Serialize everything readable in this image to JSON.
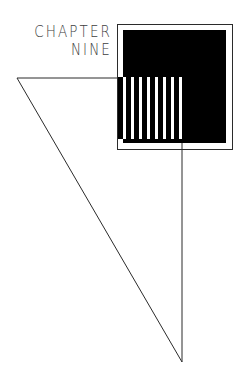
{
  "page": {
    "width": 247,
    "height": 367,
    "background": "#ffffff",
    "kind": "chapter-divider-illustration"
  },
  "heading": {
    "line1": "CHAPTER",
    "line2": "NINE",
    "color": "#3d3d3d"
  },
  "colors": {
    "ink": "#000000",
    "line": "#2b2b2b",
    "paper": "#ffffff",
    "text": "#3d3d3d"
  },
  "shapes": {
    "outer_frame": {
      "name": "outer-frame-rectangle",
      "x": 117,
      "y": 24,
      "width": 115,
      "height": 125,
      "stroke": "#2b2b2b",
      "stroke_width": 1,
      "fill": "none"
    },
    "black_square": {
      "name": "black-filled-square",
      "x": 123,
      "y": 30,
      "width": 103,
      "height": 113,
      "fill": "#000000"
    },
    "stripes": {
      "name": "vertical-stripe-band",
      "x": 118,
      "y": 77,
      "width": 65,
      "height": 62,
      "count": 8,
      "bar_width": 5,
      "gap_width": 3,
      "bar_fill": "#000000",
      "gap_fill": "#ffffff"
    },
    "triangle": {
      "name": "outline-triangle",
      "points": [
        [
          17,
          78
        ],
        [
          182,
          78
        ],
        [
          182,
          362
        ]
      ],
      "stroke": "#2b2b2b",
      "stroke_width": 1,
      "fill": "none"
    }
  }
}
